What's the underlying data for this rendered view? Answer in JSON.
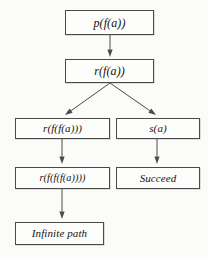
{
  "diagram": {
    "type": "flowchart",
    "background_color": "#fbfbf9",
    "border_color": "#4a4a48",
    "text_color": "#15140f",
    "nodes": [
      {
        "id": "n1",
        "label": "p(f(a))",
        "name": "node-p-f-a",
        "x": 65,
        "y": 10,
        "w": 89,
        "h": 25,
        "size": "md"
      },
      {
        "id": "n2",
        "label": "r(f(a))",
        "name": "node-r-f-a",
        "x": 65,
        "y": 59,
        "w": 89,
        "h": 24,
        "size": "md"
      },
      {
        "id": "n3",
        "label": "r(f(f(a)))",
        "name": "node-r-f-f-a",
        "x": 15,
        "y": 118,
        "w": 95,
        "h": 21,
        "size": "sm"
      },
      {
        "id": "n4",
        "label": "s(a)",
        "name": "node-s-a",
        "x": 116,
        "y": 118,
        "w": 84,
        "h": 21,
        "size": "sm"
      },
      {
        "id": "n5",
        "label": "r(f(f(f(a))))",
        "name": "node-r-f-f-f-a",
        "x": 15,
        "y": 167,
        "w": 95,
        "h": 22,
        "size": "xs"
      },
      {
        "id": "n6",
        "label": "Succeed",
        "name": "node-succeed",
        "x": 116,
        "y": 167,
        "w": 84,
        "h": 22,
        "size": "sm"
      },
      {
        "id": "n7",
        "label": "Infinite path",
        "name": "node-infinite-path",
        "x": 15,
        "y": 222,
        "w": 89,
        "h": 23,
        "size": "sm"
      }
    ],
    "edges": [
      {
        "id": "e1",
        "from": "n1",
        "to": "n2",
        "name": "edge-p-f-a-to-r-f-a",
        "x1": 110,
        "y1": 35,
        "x2": 110,
        "y2": 57
      },
      {
        "id": "e2",
        "from": "n2",
        "to": "n3",
        "name": "edge-r-f-a-to-r-f-f-a",
        "x1": 110,
        "y1": 83,
        "x2": 65,
        "y2": 115
      },
      {
        "id": "e3",
        "from": "n2",
        "to": "n4",
        "name": "edge-r-f-a-to-s-a",
        "x1": 110,
        "y1": 83,
        "x2": 156,
        "y2": 115
      },
      {
        "id": "e4",
        "from": "n3",
        "to": "n5",
        "name": "edge-r-f-f-a-to-r-f-f-f-a",
        "x1": 62,
        "y1": 139,
        "x2": 62,
        "y2": 164
      },
      {
        "id": "e5",
        "from": "n4",
        "to": "n6",
        "name": "edge-s-a-to-succeed",
        "x1": 157,
        "y1": 139,
        "x2": 157,
        "y2": 164
      },
      {
        "id": "e6",
        "from": "n5",
        "to": "n7",
        "name": "edge-r-f-f-f-a-to-infinite-path",
        "x1": 62,
        "y1": 189,
        "x2": 62,
        "y2": 219
      }
    ]
  }
}
